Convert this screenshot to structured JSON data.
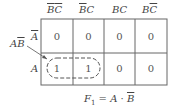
{
  "columns": [
    {
      "label": "BC",
      "a": "B",
      "b": "C",
      "a_bar": true,
      "b_bar": true
    },
    {
      "label": "B̄C",
      "a": "B",
      "b": "C",
      "a_bar": true,
      "b_bar": false
    },
    {
      "label": "BC",
      "a": "B",
      "b": "C",
      "a_bar": false,
      "b_bar": false
    },
    {
      "label": "BC̄",
      "a": "B",
      "b": "C",
      "a_bar": false,
      "b_bar": true
    }
  ],
  "rows": [
    {
      "label": "A",
      "bar": true,
      "values": [
        "0",
        "0",
        "0",
        "0"
      ]
    },
    {
      "label": "A",
      "bar": false,
      "values": [
        "1",
        "1",
        "0",
        "0"
      ]
    }
  ],
  "group": {
    "label_a": "A",
    "label_b": "B",
    "b_bar": true
  },
  "equation": {
    "lhs": "F",
    "sub": "1",
    "rhs_a": "A",
    "op": "·",
    "rhs_b": "B"
  }
}
